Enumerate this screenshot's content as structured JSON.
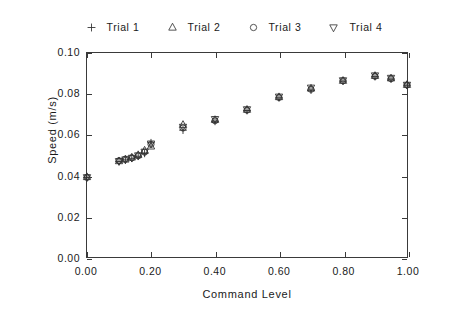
{
  "chart_data": {
    "type": "scatter",
    "title": "",
    "xlabel": "Command Level",
    "ylabel": "Speed (m/s)",
    "xlim": [
      0.0,
      1.0
    ],
    "ylim": [
      0.0,
      0.1
    ],
    "xticks": [
      "0.00",
      "0.20",
      "0.40",
      "0.60",
      "0.80",
      "1.00"
    ],
    "xtick_values": [
      0.0,
      0.2,
      0.4,
      0.6,
      0.8,
      1.0
    ],
    "yticks": [
      "0.00",
      "0.02",
      "0.04",
      "0.06",
      "0.08",
      "0.10"
    ],
    "ytick_values": [
      0.0,
      0.02,
      0.04,
      0.06,
      0.08,
      0.1
    ],
    "grid": false,
    "legend_position": "above-plot",
    "x": [
      0.0,
      0.1,
      0.12,
      0.14,
      0.16,
      0.18,
      0.2,
      0.3,
      0.4,
      0.5,
      0.6,
      0.7,
      0.8,
      0.9,
      0.95,
      1.0
    ],
    "series": [
      {
        "name": "Trial 1",
        "marker": "plus",
        "values": [
          0.039,
          0.0468,
          0.0476,
          0.0484,
          0.0494,
          0.0508,
          0.056,
          0.0622,
          0.0665,
          0.0718,
          0.078,
          0.0818,
          0.0862,
          0.0884,
          0.0872,
          0.0842
        ]
      },
      {
        "name": "Trial 2",
        "marker": "triangle-up",
        "values": [
          0.0392,
          0.047,
          0.0478,
          0.0488,
          0.05,
          0.0522,
          0.0542,
          0.0648,
          0.0672,
          0.0722,
          0.0784,
          0.0826,
          0.0864,
          0.0888,
          0.0876,
          0.0844
        ]
      },
      {
        "name": "Trial 3",
        "marker": "circle",
        "values": [
          0.039,
          0.0472,
          0.048,
          0.0486,
          0.0496,
          0.0514,
          0.0552,
          0.0632,
          0.0668,
          0.072,
          0.0782,
          0.0822,
          0.0864,
          0.0886,
          0.0874,
          0.0843
        ]
      },
      {
        "name": "Trial 4",
        "marker": "triangle-down",
        "values": [
          0.0391,
          0.047,
          0.0478,
          0.0486,
          0.0498,
          0.0516,
          0.0556,
          0.0638,
          0.0676,
          0.0724,
          0.0786,
          0.083,
          0.0866,
          0.089,
          0.0878,
          0.0844
        ]
      }
    ],
    "marker_color": "#333333"
  },
  "legend": {
    "entries": [
      {
        "label": "Trial  1",
        "marker": "plus"
      },
      {
        "label": "Trial  2",
        "marker": "triangle-up"
      },
      {
        "label": "Trial  3",
        "marker": "circle"
      },
      {
        "label": "Trial  4",
        "marker": "triangle-down"
      }
    ]
  }
}
